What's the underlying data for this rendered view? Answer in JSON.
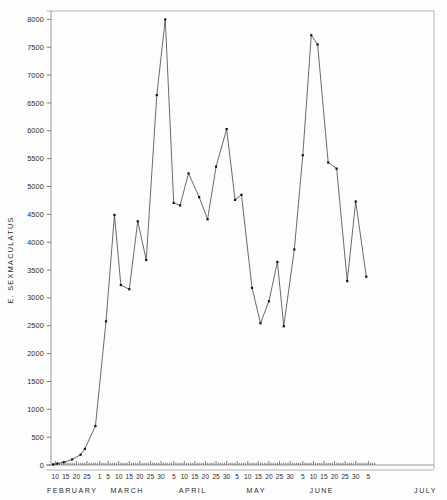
{
  "chart_data": {
    "type": "line",
    "title": "",
    "subtitle": "",
    "xlabel": "",
    "ylabel": "E. SEXMACULATUS",
    "ylim": [
      0,
      8150
    ],
    "xlim": [
      8,
      189
    ],
    "grid": false,
    "legend": null,
    "y_ticks": [
      0,
      500,
      1000,
      1500,
      2000,
      2500,
      3000,
      3500,
      4000,
      4500,
      5000,
      5500,
      6000,
      6500,
      7000,
      7500,
      8000
    ],
    "y_tick_labels": [
      "0",
      "500",
      "1000",
      "1500",
      "2000",
      "2500",
      "3000",
      "3500",
      "4000",
      "4500",
      "5000",
      "5500",
      "6000",
      "6500",
      "7000",
      "7500",
      "8000"
    ],
    "months": [
      {
        "name": "FEBRUARY",
        "center_day": 18
      },
      {
        "name": "MARCH",
        "center_day": 44
      },
      {
        "name": "APRIL",
        "center_day": 75
      },
      {
        "name": "MAY",
        "center_day": 105
      },
      {
        "name": "JUNE",
        "center_day": 136
      },
      {
        "name": "JULY",
        "center_day": 185
      }
    ],
    "x_ticks": [
      {
        "day": 10,
        "label": "10"
      },
      {
        "day": 15,
        "label": "15"
      },
      {
        "day": 20,
        "label": "20"
      },
      {
        "day": 25,
        "label": "25"
      },
      {
        "day": 31,
        "label": "1"
      },
      {
        "day": 35,
        "label": "5"
      },
      {
        "day": 40,
        "label": "10"
      },
      {
        "day": 45,
        "label": "15"
      },
      {
        "day": 50,
        "label": "20"
      },
      {
        "day": 55,
        "label": "25"
      },
      {
        "day": 60,
        "label": "30"
      },
      {
        "day": 66,
        "label": "5"
      },
      {
        "day": 71,
        "label": "10"
      },
      {
        "day": 76,
        "label": "15"
      },
      {
        "day": 81,
        "label": "20"
      },
      {
        "day": 86,
        "label": "25"
      },
      {
        "day": 91,
        "label": "30"
      },
      {
        "day": 96,
        "label": "5"
      },
      {
        "day": 101,
        "label": "10"
      },
      {
        "day": 106,
        "label": "15"
      },
      {
        "day": 111,
        "label": "20"
      },
      {
        "day": 116,
        "label": "25"
      },
      {
        "day": 121,
        "label": "30"
      },
      {
        "day": 127,
        "label": "5"
      },
      {
        "day": 132,
        "label": "10"
      },
      {
        "day": 137,
        "label": "15"
      },
      {
        "day": 142,
        "label": "20"
      },
      {
        "day": 147,
        "label": "25"
      },
      {
        "day": 152,
        "label": "30"
      },
      {
        "day": 158,
        "label": "5"
      }
    ],
    "x_minor_ticks": [
      11,
      12,
      13,
      14,
      16,
      17,
      18,
      19,
      21,
      22,
      23,
      24,
      26,
      27,
      28,
      29,
      30,
      32,
      33,
      34,
      36,
      37,
      38,
      39,
      41,
      42,
      43,
      44,
      46,
      47,
      48,
      49,
      51,
      52,
      53,
      54,
      56,
      57,
      58,
      59,
      61,
      62,
      63,
      64,
      65,
      67,
      68,
      69,
      70,
      72,
      73,
      74,
      75,
      77,
      78,
      79,
      80,
      82,
      83,
      84,
      85,
      87,
      88,
      89,
      90,
      92,
      93,
      94,
      95,
      97,
      98,
      99,
      100,
      102,
      103,
      104,
      105,
      107,
      108,
      109,
      110,
      112,
      113,
      114,
      115,
      117,
      118,
      119,
      120,
      122,
      123,
      124,
      125,
      126,
      128,
      129,
      130,
      131,
      133,
      134,
      135,
      136,
      138,
      139,
      140,
      141,
      143,
      144,
      145,
      146,
      148,
      149,
      150,
      151,
      153,
      154,
      155,
      156,
      157,
      159,
      160,
      161
    ],
    "series": [
      {
        "name": "E. sexmaculatus",
        "points": [
          {
            "x": 9,
            "y": 10
          },
          {
            "x": 11,
            "y": 25
          },
          {
            "x": 14,
            "y": 50
          },
          {
            "x": 18,
            "y": 100
          },
          {
            "x": 22,
            "y": 185
          },
          {
            "x": 24,
            "y": 290
          },
          {
            "x": 29,
            "y": 700
          },
          {
            "x": 34,
            "y": 2580
          },
          {
            "x": 38,
            "y": 4490
          },
          {
            "x": 41,
            "y": 3230
          },
          {
            "x": 45,
            "y": 3155
          },
          {
            "x": 49,
            "y": 4375
          },
          {
            "x": 53,
            "y": 3680
          },
          {
            "x": 58,
            "y": 6640
          },
          {
            "x": 62,
            "y": 8000
          },
          {
            "x": 66,
            "y": 4705
          },
          {
            "x": 69,
            "y": 4660
          },
          {
            "x": 73,
            "y": 5235
          },
          {
            "x": 78,
            "y": 4810
          },
          {
            "x": 82,
            "y": 4410
          },
          {
            "x": 86,
            "y": 5355
          },
          {
            "x": 91,
            "y": 6030
          },
          {
            "x": 95,
            "y": 4760
          },
          {
            "x": 98,
            "y": 4850
          },
          {
            "x": 103,
            "y": 3180
          },
          {
            "x": 107,
            "y": 2545
          },
          {
            "x": 111,
            "y": 2940
          },
          {
            "x": 115,
            "y": 3645
          },
          {
            "x": 118,
            "y": 2490
          },
          {
            "x": 123,
            "y": 3870
          },
          {
            "x": 127,
            "y": 5560
          },
          {
            "x": 131,
            "y": 7715
          },
          {
            "x": 134,
            "y": 7550
          },
          {
            "x": 139,
            "y": 5430
          },
          {
            "x": 143,
            "y": 5320
          },
          {
            "x": 148,
            "y": 3300
          },
          {
            "x": 152,
            "y": 4730
          },
          {
            "x": 157,
            "y": 3380
          }
        ]
      }
    ]
  }
}
